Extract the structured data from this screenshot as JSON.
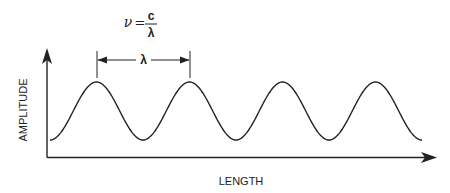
{
  "diagram": {
    "type": "wave-diagram",
    "formula": {
      "lhs": "ν",
      "equals": "=",
      "numerator": "c",
      "denominator": "λ"
    },
    "wavelength_label": "λ",
    "y_axis_label": "AMPLITUDE",
    "x_axis_label": "LENGTH",
    "wave": {
      "peaks": 4,
      "troughs": 3,
      "start_x": 50,
      "period_px": 93,
      "peak_y": 82,
      "trough_y": 140
    },
    "colors": {
      "stroke": "#222222",
      "background": "#ffffff"
    }
  }
}
